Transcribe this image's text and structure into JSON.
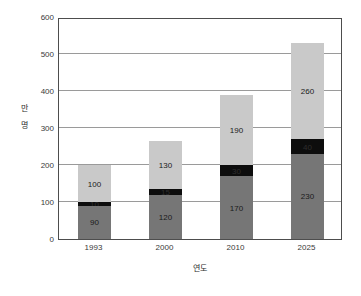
{
  "chart_data": {
    "type": "bar",
    "stacked": true,
    "title": "",
    "subtitle": "",
    "xlabel": "연도",
    "ylabel": "만 명",
    "categories": [
      "1993",
      "2000",
      "2010",
      "2025"
    ],
    "series": [
      {
        "name": "bottom-segment",
        "color": "#767676",
        "values": [
          90,
          120,
          170,
          230
        ],
        "labels": [
          "90",
          "120",
          "170",
          "230"
        ]
      },
      {
        "name": "middle-segment",
        "color": "#0d0d0d",
        "values": [
          10,
          15,
          30,
          40
        ],
        "labels": [
          "10",
          "15",
          "30",
          "40"
        ]
      },
      {
        "name": "top-segment",
        "color": "#c9c9c9",
        "values": [
          100,
          130,
          190,
          260
        ],
        "labels": [
          "100",
          "130",
          "190",
          "260"
        ]
      }
    ],
    "totals": [
      200,
      265,
      390,
      530
    ],
    "ylim": [
      0,
      600
    ],
    "yticks": [
      0,
      100,
      200,
      300,
      400,
      500,
      600
    ],
    "ytick_labels": [
      "0",
      "100",
      "200",
      "300",
      "400",
      "500",
      "600"
    ],
    "grid": true,
    "grid_axis": "y",
    "legend": false,
    "legend_position": "none",
    "axis_frame_color": "#4d4d4d",
    "gridline_color": "#9a9a9a",
    "background": "#ffffff"
  }
}
